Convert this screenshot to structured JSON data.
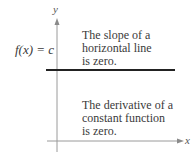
{
  "diagram": {
    "axes": {
      "x_label": "x",
      "y_label": "y"
    },
    "function_label": "f(x) = c",
    "annotation_top": {
      "line1": "The slope of a",
      "line2": "horizontal line",
      "line3": "is zero."
    },
    "annotation_bottom": {
      "line1": "The derivative of a",
      "line2": "constant function",
      "line3": "is zero."
    },
    "colors": {
      "axis": "#9a9a9a",
      "function_line": "#222222",
      "text": "#3a3a3a"
    }
  }
}
